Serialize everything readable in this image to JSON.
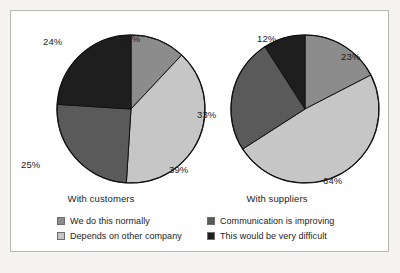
{
  "chart_data": {
    "type": "pie",
    "title": "",
    "legend_position": "bottom",
    "categories": [
      "We do this normally",
      "Depends on other company",
      "Communication is improving",
      "This would be very difficult"
    ],
    "colors": [
      "#8c8c8c",
      "#c6c6c6",
      "#5a5a5a",
      "#1e1e1e"
    ],
    "charts": [
      {
        "label": "With customers",
        "slices": [
          {
            "name": "We do this normally",
            "value": 12,
            "label": "12%",
            "color": "#8c8c8c"
          },
          {
            "name": "Depends on other company",
            "value": 39,
            "label": "39%",
            "color": "#c6c6c6"
          },
          {
            "name": "Communication is improving",
            "value": 25,
            "label": "25%",
            "color": "#5a5a5a"
          },
          {
            "name": "This would be very difficult",
            "value": 24,
            "label": "24%",
            "color": "#1e1e1e"
          }
        ]
      },
      {
        "label": "With suppliers",
        "slices": [
          {
            "name": "We do this normally",
            "value": 23,
            "label": "23%",
            "color": "#8c8c8c"
          },
          {
            "name": "Depends on other company",
            "value": 64,
            "label": "64%",
            "color": "#c6c6c6"
          },
          {
            "name": "Communication is improving",
            "value": 33,
            "label": "33%",
            "color": "#5a5a5a"
          },
          {
            "name": "This would be very difficult",
            "value": 12,
            "label": "12%",
            "color": "#1e1e1e"
          }
        ]
      }
    ]
  },
  "pies": {
    "left": {
      "caption": "With customers",
      "pct_top": "12%",
      "pct_right": "39%",
      "pct_left": "25%",
      "pct_topleft": "24%"
    },
    "right": {
      "caption": "With suppliers",
      "pct_top": "12%",
      "pct_topright": "23%",
      "pct_bottomright": "64%",
      "pct_left": "33%"
    }
  },
  "legend": {
    "items": [
      {
        "label": "We do this normally",
        "color": "#8c8c8c"
      },
      {
        "label": "Communication is improving",
        "color": "#5a5a5a"
      },
      {
        "label": "Depends on other company",
        "color": "#c6c6c6"
      },
      {
        "label": "This would be very difficult",
        "color": "#1e1e1e"
      }
    ]
  }
}
